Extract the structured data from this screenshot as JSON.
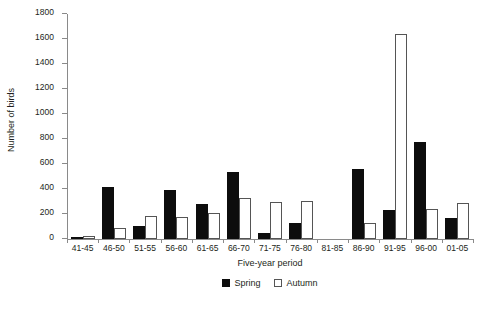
{
  "chart_data": {
    "type": "bar",
    "title": "",
    "xlabel": "Five-year period",
    "ylabel": "Number of birds",
    "categories": [
      "41-45",
      "46-50",
      "51-55",
      "56-60",
      "61-65",
      "66-70",
      "71-75",
      "76-80",
      "81-85",
      "86-90",
      "91-95",
      "96-00",
      "01-05"
    ],
    "series": [
      {
        "name": "Spring",
        "color": "#0d0d0d",
        "values": [
          5,
          415,
          105,
          390,
          280,
          535,
          45,
          130,
          0,
          560,
          235,
          780,
          165
        ]
      },
      {
        "name": "Autumn",
        "color": "#ffffff",
        "values": [
          25,
          85,
          185,
          175,
          205,
          325,
          300,
          305,
          0,
          130,
          1640,
          240,
          290
        ]
      }
    ],
    "ylim": [
      0,
      1800
    ],
    "yticks": [
      0,
      200,
      400,
      600,
      800,
      1000,
      1200,
      1400,
      1600,
      1800
    ],
    "ytick_labels": [
      "0",
      "200",
      "400",
      "600",
      "800",
      "1000",
      "1200",
      "1400",
      "1600",
      "1800"
    ],
    "grid": false,
    "legend_position": "bottom-center",
    "legend": [
      "Spring",
      "Autumn"
    ]
  }
}
